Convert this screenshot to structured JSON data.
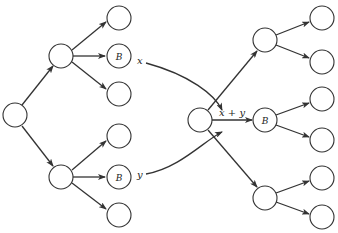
{
  "diagram": {
    "type": "tree-merge",
    "colors": {
      "stroke": "#333333",
      "fill": "#ffffff",
      "text": "#222222"
    },
    "labels": {
      "x": "x",
      "y": "y",
      "sum": "x + y",
      "left_upper_b": "B",
      "left_lower_b": "B",
      "right_mid_b": "B"
    },
    "left_tree": {
      "root": {
        "id": "L0",
        "label": ""
      },
      "children": [
        {
          "id": "L1",
          "label": "",
          "children": [
            "",
            "B",
            ""
          ]
        },
        {
          "id": "L2",
          "label": "",
          "children": [
            "",
            "B",
            ""
          ]
        }
      ]
    },
    "right_tree": {
      "root": {
        "id": "R0",
        "label": "",
        "incoming": "x + y"
      },
      "children": [
        {
          "id": "R1",
          "label": "",
          "children": [
            "",
            ""
          ]
        },
        {
          "id": "R2",
          "label": "B",
          "children": [
            "",
            ""
          ]
        },
        {
          "id": "R3",
          "label": "",
          "children": [
            "",
            ""
          ]
        }
      ]
    },
    "connections": [
      {
        "from": "left_upper_B",
        "to": "R0",
        "label": "x"
      },
      {
        "from": "left_lower_B",
        "to": "R0",
        "label": "y"
      }
    ]
  }
}
